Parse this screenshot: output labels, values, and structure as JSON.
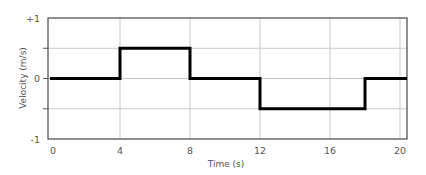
{
  "chart_data": {
    "type": "line",
    "title": "",
    "xlabel": "Time (s)",
    "ylabel": "Velocity (m/s)",
    "xlim": [
      0,
      20.4
    ],
    "ylim": [
      -1,
      1
    ],
    "x_ticks": [
      "0",
      "4",
      "8",
      "12",
      "16",
      "20"
    ],
    "y_ticks": [
      "+1",
      "0",
      "-1"
    ],
    "grid": true,
    "legend": null,
    "series": [
      {
        "name": "velocity",
        "step": true,
        "x": [
          0,
          4,
          4,
          8,
          8,
          12,
          12,
          18,
          18,
          20.4
        ],
        "y": [
          0,
          0,
          0.5,
          0.5,
          0,
          0,
          -0.5,
          -0.5,
          0,
          0
        ]
      }
    ],
    "colors": {
      "line": "#000000",
      "grid": "#c8c8c8",
      "frame": "#555555",
      "text": "#555555"
    }
  }
}
